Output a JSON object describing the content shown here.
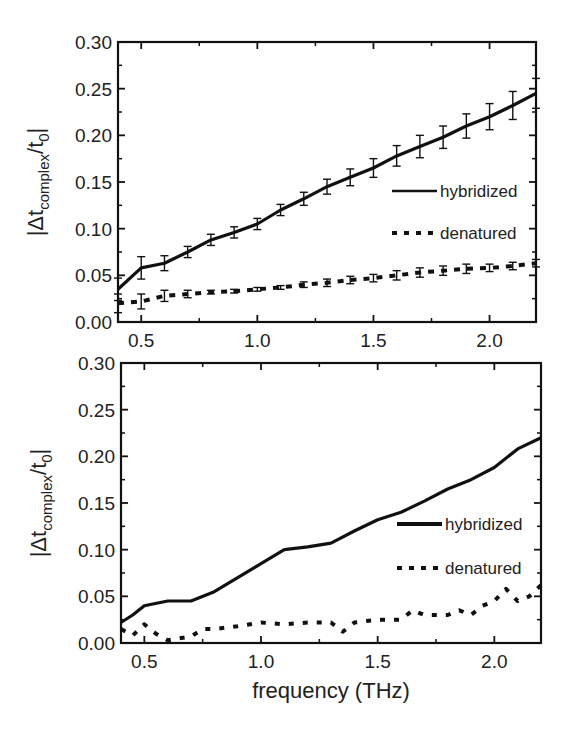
{
  "chart_data": [
    {
      "type": "line",
      "panel": "top",
      "title": "",
      "xlabel": "",
      "ylabel": "|Δt_complex/t_0|",
      "ylabel_parts": {
        "prefix": "|Δt",
        "sub": "complex",
        "mid": "/t",
        "sub2": "0",
        "suffix": "|"
      },
      "xlim": [
        0.4,
        2.2
      ],
      "ylim": [
        0.0,
        0.3
      ],
      "xticks": [
        "0.5",
        "1.0",
        "1.5",
        "2.0"
      ],
      "yticks": [
        "0.00",
        "0.05",
        "0.10",
        "0.15",
        "0.20",
        "0.25",
        "0.30"
      ],
      "grid": false,
      "error_bars": true,
      "legend_position": "center-right",
      "series": [
        {
          "name": "hybridized",
          "style": "solid",
          "x": [
            0.4,
            0.5,
            0.6,
            0.7,
            0.8,
            0.9,
            1.0,
            1.1,
            1.2,
            1.3,
            1.4,
            1.5,
            1.6,
            1.7,
            1.8,
            1.9,
            2.0,
            2.1,
            2.2
          ],
          "values": [
            0.035,
            0.058,
            0.063,
            0.075,
            0.088,
            0.096,
            0.105,
            0.12,
            0.132,
            0.145,
            0.155,
            0.165,
            0.178,
            0.188,
            0.198,
            0.21,
            0.22,
            0.232,
            0.245
          ],
          "errors": [
            0.012,
            0.012,
            0.008,
            0.006,
            0.006,
            0.006,
            0.006,
            0.006,
            0.007,
            0.008,
            0.009,
            0.01,
            0.011,
            0.012,
            0.012,
            0.013,
            0.014,
            0.015,
            0.016
          ]
        },
        {
          "name": "denatured",
          "style": "dotted",
          "x": [
            0.4,
            0.5,
            0.6,
            0.7,
            0.8,
            0.9,
            1.0,
            1.1,
            1.2,
            1.3,
            1.4,
            1.5,
            1.6,
            1.7,
            1.8,
            1.9,
            2.0,
            2.1,
            2.2
          ],
          "values": [
            0.02,
            0.022,
            0.028,
            0.03,
            0.032,
            0.033,
            0.035,
            0.037,
            0.04,
            0.042,
            0.045,
            0.047,
            0.05,
            0.053,
            0.055,
            0.057,
            0.058,
            0.06,
            0.063
          ],
          "errors": [
            0.01,
            0.008,
            0.006,
            0.004,
            0.002,
            0.002,
            0.002,
            0.002,
            0.003,
            0.004,
            0.004,
            0.004,
            0.005,
            0.005,
            0.005,
            0.005,
            0.004,
            0.004,
            0.004
          ]
        }
      ]
    },
    {
      "type": "line",
      "panel": "bottom",
      "title": "",
      "xlabel": "frequency (THz)",
      "ylabel": "|Δt_complex/t_0|",
      "ylabel_parts": {
        "prefix": "|Δt",
        "sub": "complex",
        "mid": "/t",
        "sub2": "0",
        "suffix": "|"
      },
      "xlim": [
        0.4,
        2.2
      ],
      "ylim": [
        0.0,
        0.3
      ],
      "xticks": [
        "0.5",
        "1.0",
        "1.5",
        "2.0"
      ],
      "yticks": [
        "0.00",
        "0.05",
        "0.10",
        "0.15",
        "0.20",
        "0.25",
        "0.30"
      ],
      "grid": false,
      "error_bars": false,
      "legend_position": "center-right",
      "series": [
        {
          "name": "hybridized",
          "style": "solid",
          "x": [
            0.4,
            0.45,
            0.5,
            0.6,
            0.7,
            0.8,
            0.9,
            1.0,
            1.1,
            1.2,
            1.3,
            1.4,
            1.5,
            1.6,
            1.7,
            1.8,
            1.9,
            2.0,
            2.1,
            2.2
          ],
          "values": [
            0.022,
            0.03,
            0.04,
            0.045,
            0.045,
            0.055,
            0.07,
            0.085,
            0.1,
            0.103,
            0.107,
            0.12,
            0.132,
            0.14,
            0.152,
            0.165,
            0.175,
            0.188,
            0.208,
            0.22
          ]
        },
        {
          "name": "denatured",
          "style": "dotted",
          "x": [
            0.4,
            0.45,
            0.5,
            0.55,
            0.6,
            0.7,
            0.75,
            0.8,
            0.9,
            1.0,
            1.1,
            1.2,
            1.3,
            1.35,
            1.4,
            1.5,
            1.6,
            1.65,
            1.7,
            1.8,
            1.85,
            1.9,
            1.95,
            2.0,
            2.05,
            2.1,
            2.15,
            2.2
          ],
          "values": [
            0.015,
            0.008,
            0.02,
            0.01,
            0.003,
            0.007,
            0.015,
            0.015,
            0.018,
            0.022,
            0.02,
            0.022,
            0.022,
            0.012,
            0.022,
            0.025,
            0.025,
            0.035,
            0.03,
            0.03,
            0.035,
            0.03,
            0.04,
            0.045,
            0.058,
            0.045,
            0.05,
            0.062
          ]
        }
      ]
    }
  ],
  "colors": {
    "line": "#111111",
    "axis": "#111111",
    "text": "#222222",
    "background": "#ffffff"
  }
}
